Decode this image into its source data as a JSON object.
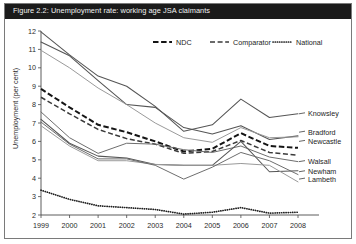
{
  "figure": {
    "title": "Figure 2.2: Unemployment rate: working age JSA claimants"
  },
  "legend": {
    "position": "top-right",
    "items": [
      {
        "label": "NDC",
        "style": "thick-dashed"
      },
      {
        "label": "Comparator",
        "style": "dashed"
      },
      {
        "label": "National",
        "style": "dotted"
      }
    ]
  },
  "right_labels": [
    {
      "label": "Knowsley",
      "y_value": 7.5
    },
    {
      "label": "Bradford",
      "y_value": 6.5
    },
    {
      "label": "Newcastle",
      "y_value": 6.0
    },
    {
      "label": "Walsall",
      "y_value": 4.9
    },
    {
      "label": "Newham",
      "y_value": 4.35
    },
    {
      "label": "Lambeth",
      "y_value": 3.95
    }
  ],
  "chart_data": {
    "type": "line",
    "title": "Figure 2.2: Unemployment rate: working age JSA claimants",
    "xlabel": "",
    "ylabel": "Unemployment (per cent)",
    "x": [
      1999,
      2000,
      2001,
      2002,
      2003,
      2004,
      2005,
      2006,
      2007,
      2008
    ],
    "xtick_labels": [
      "1999",
      "2000",
      "2001",
      "2002",
      "2003",
      "2004",
      "2005",
      "2006",
      "2007",
      "2008"
    ],
    "ytick_labels": [
      "2",
      "3",
      "4",
      "5",
      "6",
      "7",
      "8",
      "9",
      "10",
      "11",
      "12"
    ],
    "ylim": [
      2,
      12
    ],
    "xlim": [
      1999,
      2008
    ],
    "grid": false,
    "legend_position": "top-right",
    "series": [
      {
        "name": "Knowsley",
        "style": "solid-gray-dark",
        "values": [
          11.95,
          10.7,
          9.55,
          9.0,
          7.9,
          6.55,
          6.9,
          8.3,
          7.3,
          7.5
        ]
      },
      {
        "name": "Bradford",
        "style": "solid-gray-dark",
        "values": [
          11.4,
          10.65,
          9.3,
          8.0,
          7.85,
          6.75,
          6.4,
          6.85,
          6.1,
          6.3
        ]
      },
      {
        "name": "Newcastle",
        "style": "solid-gray-light",
        "values": [
          10.95,
          10.0,
          8.9,
          8.0,
          7.0,
          6.2,
          5.95,
          6.75,
          6.2,
          6.25
        ]
      },
      {
        "name": "NDC",
        "style": "thick-dashed",
        "values": [
          8.85,
          7.85,
          6.9,
          6.5,
          6.0,
          5.45,
          5.6,
          6.45,
          5.75,
          5.65
        ]
      },
      {
        "name": "Comparator",
        "style": "dashed",
        "values": [
          8.4,
          7.5,
          6.65,
          6.15,
          5.85,
          5.35,
          5.45,
          6.05,
          5.4,
          5.25
        ]
      },
      {
        "name": "Walsall",
        "style": "solid-gray",
        "values": [
          7.6,
          6.2,
          5.35,
          5.9,
          5.85,
          5.55,
          5.4,
          5.75,
          5.15,
          4.9
        ]
      },
      {
        "name": "Newham",
        "style": "solid-gray-dark",
        "values": [
          7.2,
          5.9,
          5.2,
          5.1,
          4.75,
          4.7,
          4.7,
          6.0,
          4.35,
          4.4
        ]
      },
      {
        "name": "Lambeth",
        "style": "solid-gray-light",
        "values": [
          6.85,
          5.75,
          4.95,
          4.95,
          4.75,
          4.7,
          4.7,
          4.8,
          4.7,
          3.8
        ]
      },
      {
        "name": "Lambeth-lower",
        "style": "solid-gray",
        "values": [
          7.05,
          5.85,
          5.05,
          5.05,
          4.7,
          3.95,
          4.6,
          5.4,
          4.95,
          4.2
        ]
      },
      {
        "name": "National",
        "style": "dotted",
        "values": [
          3.35,
          2.85,
          2.5,
          2.4,
          2.3,
          2.05,
          2.15,
          2.4,
          2.1,
          2.15
        ]
      }
    ]
  }
}
